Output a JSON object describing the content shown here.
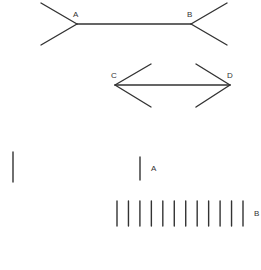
{
  "figure": {
    "muller_lyer": {
      "top": {
        "left_label": "A",
        "right_label": "B",
        "fins": "outward"
      },
      "bottom": {
        "left_label": "C",
        "right_label": "D",
        "fins": "inward"
      }
    },
    "filled_space": {
      "label_a": "A",
      "label_b": "B",
      "b_segment_count": 12
    }
  },
  "colors": {
    "ink": "#333333",
    "background": "#ffffff"
  }
}
